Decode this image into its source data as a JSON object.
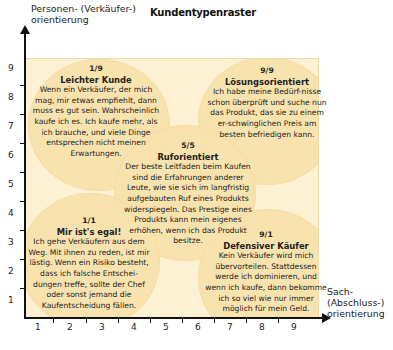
{
  "title": "Kundentypenraster",
  "axes": {
    "y_label_line1": "Personen- (Verkäufer-)",
    "y_label_line2": "orientierung",
    "x_label_line1": "Sach-",
    "x_label_line2": "(Abschluss-)",
    "x_label_line3": "orientierung",
    "y_ticks": [
      "1",
      "2",
      "3",
      "4",
      "5",
      "6",
      "7",
      "8",
      "9"
    ],
    "x_ticks": [
      "1",
      "2",
      "3",
      "4",
      "5",
      "6",
      "7",
      "8",
      "9"
    ]
  },
  "colors": {
    "plot_background": "#fcf1d2",
    "circle_fill": "#f8e2ad",
    "axis": "#111111"
  },
  "types": [
    {
      "grid": "1/9",
      "name": "Leichter Kunde",
      "text": "Wenn ein Verkäufer, der mich mag, mir etwas empfiehlt, dann muss es gut sein. Wahrscheinlich kaufe ich es. Ich kaufe mehr, als ich brauche, und viele Dinge entsprechen nicht meinen Erwartungen."
    },
    {
      "grid": "9/9",
      "name": "Lösungsorientiert",
      "text": "Ich habe meine Bedürf-nisse schon überprüft und suche nun das Produkt, das sie zu einem er-schwinglichen Preis am besten befriedigen kann."
    },
    {
      "grid": "5/5",
      "name": "Ruforientiert",
      "text": "Der beste Leitfaden beim Kaufen sind die Erfahrungen anderer Leute, wie sie sich im langfristig aufgebauten Ruf eines Produkts widerspiegeln. Das Prestige eines Produkts kann mein eigenes erhöhen, wenn ich das Produkt besitze."
    },
    {
      "grid": "1/1",
      "name": "Mir ist's egal!",
      "text": "Ich gehe Verkäufern aus dem Weg. Mit ihnen zu reden, ist mir lästig. Wenn ein Risiko besteht, dass ich falsche Entschei-dungen treffe, sollte der Chef oder sonst jemand die Kaufentscheidung fällen."
    },
    {
      "grid": "9/1",
      "name": "Defensiver Käufer",
      "text": "Kein Verkäufer wird mich übervorteilen. Stattdessen werde ich dominieren, und wenn ich kaufe, dann bekomme ich so viel wie nur immer möglich für mein Geld."
    }
  ]
}
